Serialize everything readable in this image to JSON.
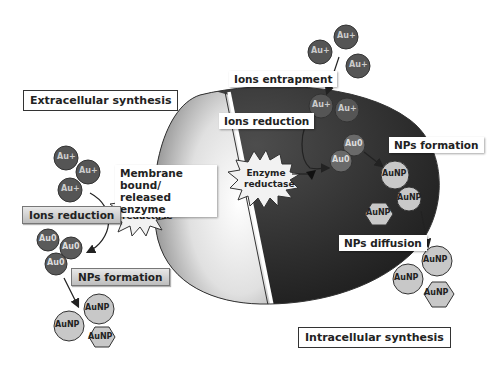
{
  "diagram": {
    "type": "microbial gold nanoparticle synthesis mechanism",
    "labels": {
      "extracellular_title": "Extracellular synthesis",
      "intracellular_title": "Intracellular synthesis",
      "membrane_enzyme": "Membrane bound/ released enzyme",
      "ions_reduction_left": "Ions reduction",
      "nps_formation_left": "NPs formation",
      "ions_entrapment": "Ions entrapment",
      "ions_reduction_right": "Ions reduction",
      "nps_formation_right": "NPs formation",
      "nps_diffusion": "NPs diffusion"
    },
    "enzyme_left": {
      "line1": "Enzyme",
      "line2": "reductase"
    },
    "enzyme_right": {
      "line1": "Enzyme",
      "line2": "reductase"
    },
    "species": {
      "gold_ion": "Au+",
      "gold_atom": "Au0",
      "nanoparticle": "AuNP"
    },
    "colors": {
      "ion_fill": "#555555",
      "atom_fill": "#6a6a6a",
      "np_fill": "#c8c8c8",
      "cell_dark": "#2b2b2b",
      "cell_light": "#d9d9d9"
    }
  }
}
